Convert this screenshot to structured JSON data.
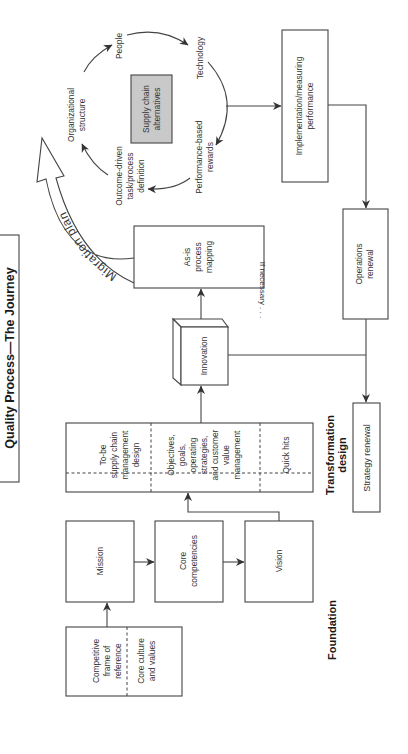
{
  "title": "Quality Process—The Journey",
  "orientation": "rotated 90° counter-clockwise (text reads bottom-to-top)",
  "colors": {
    "line": "#444444",
    "text": "#333333",
    "highlight_box_fill": "#c9c9c9",
    "background": "#ffffff"
  },
  "sections": {
    "foundation": "Foundation",
    "transformation_line1": "Transformation",
    "transformation_line2": "design"
  },
  "foundation": {
    "competitive_box": {
      "left_line1": "Competitive",
      "left_line2": "frame of",
      "left_line3": "reference",
      "right_line1": "Core culture",
      "right_line2": "and values"
    },
    "mission": "Mission",
    "core_competencies_line1": "Core",
    "core_competencies_line2": "competencies",
    "vision": "Vision"
  },
  "transformation": {
    "tobe_box": {
      "part1_line1": "To-be",
      "part1_line2": "supply chain",
      "part1_line3": "management",
      "part1_line4": "design",
      "part2_line1": "Objectives,",
      "part2_line2": "goals,",
      "part2_line3": "operating",
      "part2_line4": "strategies,",
      "part2_line5": "and customer",
      "part2_line6": "value",
      "part2_line7": "management",
      "part3": "Quick hits"
    },
    "innovation": "Innovation",
    "asis_line1": "As-is",
    "asis_line2": "process",
    "asis_line3": "mapping",
    "strategy_renewal": "Strategy renewal",
    "if_necessary": "If necessary . . ."
  },
  "migration": {
    "arrow_label": "Migration plan",
    "center_box_line1": "Supply chain",
    "center_box_line2": "alternatives",
    "cycle": [
      {
        "id": "organizational",
        "line1": "Organizational",
        "line2": "structure"
      },
      {
        "id": "people",
        "line1": "People"
      },
      {
        "id": "technology",
        "line1": "Technology"
      },
      {
        "id": "performance",
        "line1": "Performance-based",
        "line2": "rewards"
      },
      {
        "id": "outcome",
        "line1": "Outcome-driven",
        "line2": "task/process",
        "line3": "definition"
      }
    ]
  },
  "implementation": {
    "implementation_line1": "Implementation/measuring",
    "implementation_line2": "performance",
    "operations_line1": "Operations",
    "operations_line2": "renewal"
  }
}
